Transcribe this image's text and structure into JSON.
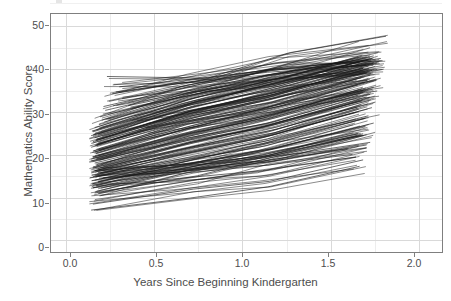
{
  "chart_data": {
    "type": "line",
    "title": "",
    "subtitle": "",
    "xlabel": "Years Since Beginning Kindergarten",
    "ylabel": "Mathematics Ability Score",
    "xlim": [
      -0.09,
      2.13
    ],
    "ylim": [
      -2.6,
      53.0
    ],
    "xticks": [
      "0.0",
      "0.5",
      "1.0",
      "1.5",
      "2.0"
    ],
    "xtick_values": [
      0.0,
      0.5,
      1.0,
      1.5,
      2.0
    ],
    "yticks": [
      "0",
      "10",
      "20",
      "30",
      "40",
      "50"
    ],
    "ytick_values": [
      0,
      10,
      20,
      30,
      40,
      50
    ],
    "grid": "major and minor gridlines, light gray, on white panel",
    "legend": "none",
    "legend_position": "none",
    "series_description": "Spaghetti plot: one thin black line per child, connecting repeated mathematics ability measurements across time. Roughly 200 individual growth trajectories, nearly all increasing.",
    "series_count": 200,
    "x_data_range": [
      0.14,
      1.81
    ],
    "y_data_range": [
      7.0,
      48.0
    ],
    "colors": {
      "line": "#1a1a1a",
      "panel_background": "#ffffff",
      "major_gridline": "#d9d9d9",
      "minor_gridline": "#ededed",
      "panel_border": "#7f7f7f",
      "text": "#4d4d4d"
    },
    "series": [
      {
        "name": "child-001",
        "x": [
          0.15,
          0.72,
          1.15,
          1.68
        ],
        "y": [
          8.6,
          12.1,
          13.9,
          18.9
        ]
      },
      {
        "name": "child-002",
        "x": [
          0.14,
          0.7,
          1.14,
          1.66
        ],
        "y": [
          7.2,
          10.0,
          12.6,
          17.4
        ]
      },
      {
        "name": "child-003",
        "x": [
          0.16,
          0.74,
          1.16,
          1.72
        ],
        "y": [
          11.2,
          15.2,
          19.5,
          23.0
        ]
      },
      {
        "name": "child-004",
        "x": [
          0.17,
          0.68,
          1.12,
          1.7
        ],
        "y": [
          11.6,
          16.4,
          19.8,
          24.8
        ]
      },
      {
        "name": "child-005",
        "x": [
          0.15,
          0.66,
          1.1,
          1.65
        ],
        "y": [
          12.4,
          17.0,
          20.0,
          25.0
        ]
      },
      {
        "name": "child-006",
        "x": [
          0.18,
          0.73,
          1.18,
          1.74
        ],
        "y": [
          13.8,
          18.3,
          21.6,
          27.5
        ]
      },
      {
        "name": "child-007",
        "x": [
          0.16,
          0.69,
          1.13,
          1.69
        ],
        "y": [
          14.2,
          19.0,
          22.2,
          28.6
        ]
      },
      {
        "name": "child-008",
        "x": [
          0.15,
          0.71,
          1.15,
          1.71
        ],
        "y": [
          15.0,
          19.7,
          23.5,
          29.2
        ]
      },
      {
        "name": "child-009",
        "x": [
          0.17,
          0.67,
          1.11,
          1.64
        ],
        "y": [
          15.4,
          20.4,
          24.1,
          30.0
        ]
      },
      {
        "name": "child-010",
        "x": [
          0.14,
          0.72,
          1.17,
          1.73
        ],
        "y": [
          15.9,
          21.0,
          24.8,
          31.1
        ]
      },
      {
        "name": "child-011",
        "x": [
          0.16,
          0.7,
          1.14,
          1.67
        ],
        "y": [
          16.4,
          21.6,
          25.4,
          31.8
        ]
      },
      {
        "name": "child-012",
        "x": [
          0.18,
          0.74,
          1.19,
          1.75
        ],
        "y": [
          16.9,
          22.2,
          26.1,
          32.4
        ]
      },
      {
        "name": "child-013",
        "x": [
          0.15,
          0.68,
          1.12,
          1.66
        ],
        "y": [
          17.3,
          22.8,
          26.7,
          33.0
        ]
      },
      {
        "name": "child-014",
        "x": [
          0.17,
          0.71,
          1.16,
          1.7
        ],
        "y": [
          17.8,
          23.3,
          27.2,
          33.6
        ]
      },
      {
        "name": "child-015",
        "x": [
          0.16,
          0.73,
          1.18,
          1.72
        ],
        "y": [
          18.2,
          23.9,
          27.9,
          34.2
        ]
      },
      {
        "name": "child-016",
        "x": [
          0.14,
          0.69,
          1.13,
          1.68
        ],
        "y": [
          18.7,
          24.4,
          28.4,
          34.7
        ]
      },
      {
        "name": "child-017",
        "x": [
          0.17,
          0.7,
          1.15,
          1.71
        ],
        "y": [
          19.1,
          25.0,
          29.0,
          35.3
        ]
      },
      {
        "name": "child-018",
        "x": [
          0.15,
          0.72,
          1.17,
          1.74
        ],
        "y": [
          19.6,
          25.5,
          29.6,
          35.9
        ]
      },
      {
        "name": "child-019",
        "x": [
          0.18,
          0.67,
          1.11,
          1.65
        ],
        "y": [
          20.0,
          26.1,
          30.1,
          36.4
        ]
      },
      {
        "name": "child-020",
        "x": [
          0.16,
          0.71,
          1.14,
          1.69
        ],
        "y": [
          20.5,
          26.6,
          30.7,
          37.0
        ]
      },
      {
        "name": "child-021",
        "x": [
          0.15,
          0.74,
          1.19,
          1.76
        ],
        "y": [
          21.0,
          27.2,
          31.3,
          37.6
        ]
      },
      {
        "name": "child-022",
        "x": [
          0.17,
          0.68,
          1.12,
          1.67
        ],
        "y": [
          21.4,
          27.7,
          31.8,
          38.1
        ]
      },
      {
        "name": "child-023",
        "x": [
          0.14,
          0.72,
          1.16,
          1.72
        ],
        "y": [
          21.9,
          28.3,
          32.4,
          38.7
        ]
      },
      {
        "name": "child-024",
        "x": [
          0.16,
          0.7,
          1.15,
          1.7
        ],
        "y": [
          22.3,
          28.8,
          33.0,
          39.2
        ]
      },
      {
        "name": "child-025",
        "x": [
          0.18,
          0.73,
          1.18,
          1.73
        ],
        "y": [
          22.8,
          29.4,
          33.5,
          39.8
        ]
      },
      {
        "name": "child-026",
        "x": [
          0.15,
          0.69,
          1.13,
          1.68
        ],
        "y": [
          23.2,
          29.9,
          34.1,
          40.3
        ]
      },
      {
        "name": "child-027",
        "x": [
          0.17,
          0.71,
          1.16,
          1.71
        ],
        "y": [
          23.7,
          30.4,
          34.6,
          40.8
        ]
      },
      {
        "name": "child-028",
        "x": [
          0.16,
          0.67,
          1.11,
          1.66
        ],
        "y": [
          24.1,
          30.9,
          35.1,
          41.3
        ]
      },
      {
        "name": "child-029",
        "x": [
          0.14,
          0.74,
          1.2,
          1.77
        ],
        "y": [
          24.6,
          31.5,
          35.7,
          41.8
        ]
      },
      {
        "name": "child-030",
        "x": [
          0.18,
          0.7,
          1.14,
          1.69
        ],
        "y": [
          25.0,
          32.0,
          36.2,
          42.2
        ]
      },
      {
        "name": "child-031",
        "x": [
          0.15,
          0.72,
          1.17,
          1.73
        ],
        "y": [
          25.5,
          32.5,
          36.7,
          42.6
        ]
      },
      {
        "name": "child-032",
        "x": [
          0.17,
          0.69,
          1.13,
          1.67
        ],
        "y": [
          26.0,
          33.0,
          37.2,
          43.0
        ]
      },
      {
        "name": "child-033",
        "x": [
          0.16,
          0.73,
          1.18,
          1.74
        ],
        "y": [
          26.5,
          33.5,
          37.7,
          43.2
        ]
      },
      {
        "name": "child-034",
        "x": [
          0.2,
          0.68,
          1.12,
          1.7
        ],
        "y": [
          28.2,
          34.2,
          38.3,
          43.0
        ]
      },
      {
        "name": "child-035",
        "x": [
          0.19,
          0.71,
          1.15,
          1.72
        ],
        "y": [
          29.0,
          34.8,
          38.8,
          42.8
        ]
      },
      {
        "name": "child-036",
        "x": [
          0.22,
          0.75,
          1.22,
          1.78
        ],
        "y": [
          30.5,
          35.6,
          39.4,
          42.6
        ]
      },
      {
        "name": "child-037",
        "x": [
          0.21,
          0.7,
          1.16,
          1.71
        ],
        "y": [
          31.4,
          36.1,
          39.8,
          42.4
        ]
      },
      {
        "name": "child-038",
        "x": [
          0.24,
          0.74,
          1.19,
          1.75
        ],
        "y": [
          32.6,
          36.8,
          40.2,
          42.3
        ]
      },
      {
        "name": "child-039",
        "x": [
          0.26,
          0.77,
          1.23,
          1.79
        ],
        "y": [
          34.4,
          37.6,
          40.6,
          42.1
        ]
      },
      {
        "name": "child-040",
        "x": [
          0.23,
          0.8,
          1.25,
          1.81
        ],
        "y": [
          38.4,
          38.0,
          43.8,
          47.8
        ]
      },
      {
        "name": "child-041",
        "x": [
          0.28,
          0.72,
          1.14,
          1.7
        ],
        "y": [
          34.8,
          37.2,
          39.4,
          41.0
        ]
      },
      {
        "name": "child-042",
        "x": [
          0.3,
          0.76,
          1.2,
          1.74
        ],
        "y": [
          36.0,
          38.0,
          40.2,
          41.2
        ]
      },
      {
        "name": "child-043",
        "x": [
          0.35,
          0.78,
          1.21,
          1.76
        ],
        "y": [
          31.6,
          35.2,
          38.0,
          40.0
        ]
      },
      {
        "name": "child-044",
        "x": [
          0.16,
          0.62,
          1.1,
          1.66
        ],
        "y": [
          15.2,
          16.0,
          18.8,
          24.6
        ]
      },
      {
        "name": "child-045",
        "x": [
          0.18,
          0.65,
          1.12,
          1.68
        ],
        "y": [
          16.0,
          17.4,
          19.4,
          25.0
        ]
      },
      {
        "name": "child-046",
        "x": [
          0.2,
          0.66,
          1.14,
          1.7
        ],
        "y": [
          14.6,
          16.2,
          18.4,
          22.4
        ]
      },
      {
        "name": "child-047",
        "x": [
          0.15,
          0.6,
          1.08,
          1.62
        ],
        "y": [
          13.4,
          15.6,
          17.4,
          20.2
        ]
      },
      {
        "name": "child-048",
        "x": [
          0.17,
          0.64,
          1.11,
          1.64
        ],
        "y": [
          12.8,
          14.6,
          16.4,
          19.6
        ]
      },
      {
        "name": "child-049",
        "x": [
          0.4,
          0.9,
          1.3,
          1.74
        ],
        "y": [
          28.0,
          31.0,
          34.5,
          37.4
        ]
      },
      {
        "name": "child-050",
        "x": [
          0.45,
          0.95,
          1.35,
          1.76
        ],
        "y": [
          26.4,
          29.5,
          32.5,
          35.0
        ]
      }
    ]
  },
  "axes": {
    "x_title": "Years Since Beginning Kindergarten",
    "y_title": "Mathematics Ability Score",
    "x_tick_labels": [
      "0.0",
      "0.5",
      "1.0",
      "1.5",
      "2.0"
    ],
    "y_tick_labels": [
      "50",
      "40",
      "30",
      "20",
      "10",
      "0"
    ]
  }
}
